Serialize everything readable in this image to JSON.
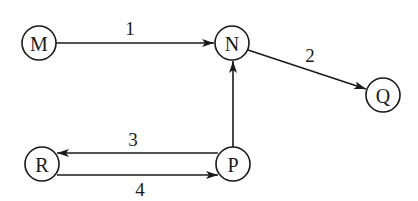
{
  "diagram": {
    "type": "directed-graph",
    "nodes": [
      {
        "id": "M",
        "label": "M",
        "x": 39,
        "y": 43
      },
      {
        "id": "N",
        "label": "N",
        "x": 232,
        "y": 43
      },
      {
        "id": "Q",
        "label": "Q",
        "x": 383,
        "y": 95
      },
      {
        "id": "R",
        "label": "R",
        "x": 42,
        "y": 164
      },
      {
        "id": "P",
        "label": "P",
        "x": 233,
        "y": 164
      }
    ],
    "edges": [
      {
        "from": "M",
        "to": "N",
        "label": "1"
      },
      {
        "from": "N",
        "to": "Q",
        "label": "2"
      },
      {
        "from": "P",
        "to": "R",
        "label": "3"
      },
      {
        "from": "R",
        "to": "P",
        "label": "4"
      },
      {
        "from": "P",
        "to": "N",
        "label": ""
      }
    ],
    "stroke_color": "#1a1a1a",
    "background": "#ffffff"
  }
}
